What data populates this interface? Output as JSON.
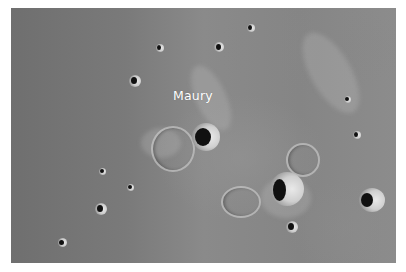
{
  "image": {
    "subject": "Lunar surface with craters",
    "label": "Maury",
    "colors": {
      "border": "#ffffff",
      "surface_dark": "#6f6f6f",
      "surface_light": "#8c8c8c",
      "crater_rim": "#e9e9e9",
      "crater_shadow": "#111111",
      "label_text": "#ffffff"
    }
  }
}
